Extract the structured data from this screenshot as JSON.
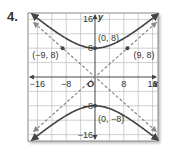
{
  "problem": {
    "number": "4."
  },
  "chart_data": {
    "type": "line",
    "title": "",
    "xlabel": "x",
    "ylabel": "y",
    "xlim": [
      -18,
      18
    ],
    "ylim": [
      -18,
      18
    ],
    "grid": true,
    "grid_step": 4,
    "x_ticks": [
      {
        "value": -16,
        "label": "−16"
      },
      {
        "value": -8,
        "label": "−8"
      },
      {
        "value": 8,
        "label": "8"
      },
      {
        "value": 16,
        "label": "16"
      }
    ],
    "y_ticks": [
      {
        "value": 16,
        "label": "16"
      },
      {
        "value": 8,
        "label": "8"
      },
      {
        "value": -8,
        "label": "−8"
      },
      {
        "value": -16,
        "label": "−16"
      }
    ],
    "origin_label": "O",
    "series": [
      {
        "name": "hyperbola-upper-branch",
        "style": "solid",
        "equation": "y^2/64 - x^2/81 = 1",
        "vertex": [
          0,
          8
        ]
      },
      {
        "name": "hyperbola-lower-branch",
        "style": "solid",
        "equation": "y^2/64 - x^2/81 = 1",
        "vertex": [
          0,
          -8
        ]
      },
      {
        "name": "asymptote-positive",
        "style": "dashed",
        "equation": "y = (8/9)x"
      },
      {
        "name": "asymptote-negative",
        "style": "dashed",
        "equation": "y = -(8/9)x"
      }
    ],
    "points": [
      {
        "label": "(0, 8)",
        "x": 0,
        "y": 8
      },
      {
        "label": "(0, −8)",
        "x": 0,
        "y": -8
      },
      {
        "label": "(−9, 8)",
        "x": -9,
        "y": 8
      },
      {
        "label": "(9, 8)",
        "x": 9,
        "y": 8
      }
    ],
    "colors": {
      "curve": "#444444",
      "asymptote": "#888888",
      "grid": "#bbbbbb",
      "axis": "#444444"
    }
  }
}
